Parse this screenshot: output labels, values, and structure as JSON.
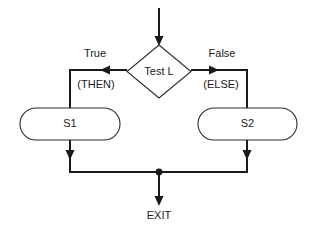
{
  "diagram": {
    "type": "flowchart",
    "background_color": "#ffffff",
    "line_color": "#1a1a1a",
    "text_color": "#1a1a1a",
    "shape_fill": "#ffffff",
    "decision": {
      "label": "Test L",
      "shape": "diamond"
    },
    "branches": {
      "left": {
        "condition": "True",
        "keyword": "(THEN)"
      },
      "right": {
        "condition": "False",
        "keyword": "(ELSE)"
      }
    },
    "processes": [
      {
        "label": "S1",
        "shape": "stadium",
        "branch": "left"
      },
      {
        "label": "S2",
        "shape": "stadium",
        "branch": "right"
      }
    ],
    "terminal": {
      "label": "EXIT"
    }
  }
}
